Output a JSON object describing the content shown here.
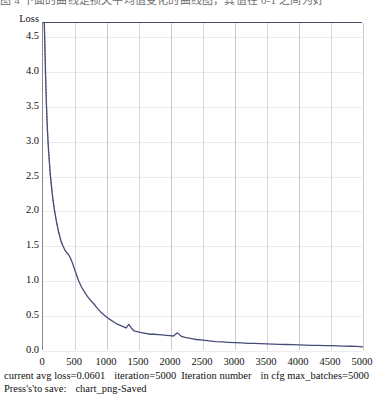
{
  "top_caption": "图 4  下面的曲线是损失平均值变化的曲线图，其值在 0-1 之间为好",
  "chart_data": {
    "type": "line",
    "title": "",
    "xlabel": "Iteration number",
    "ylabel": "Loss",
    "xlim": [
      0,
      5000
    ],
    "ylim": [
      0.0,
      4.7
    ],
    "grid": true,
    "legend": null,
    "xticks": [
      0,
      500,
      1000,
      1500,
      2000,
      2500,
      3000,
      3500,
      4000,
      4500,
      5000
    ],
    "yticks": [
      0.0,
      0.5,
      1.0,
      1.5,
      2.0,
      2.5,
      3.0,
      3.5,
      4.0,
      4.5
    ],
    "series": [
      {
        "name": "avg loss",
        "color": "#464c78",
        "x": [
          20,
          30,
          40,
          55,
          70,
          85,
          100,
          115,
          130,
          145,
          160,
          175,
          190,
          205,
          220,
          240,
          260,
          280,
          300,
          320,
          340,
          360,
          380,
          400,
          430,
          460,
          490,
          520,
          560,
          600,
          640,
          680,
          720,
          760,
          800,
          850,
          900,
          950,
          1000,
          1050,
          1100,
          1150,
          1200,
          1250,
          1300,
          1340,
          1380,
          1420,
          1460,
          1500,
          1560,
          1620,
          1680,
          1740,
          1800,
          1860,
          1920,
          1980,
          2040,
          2100,
          2160,
          2220,
          2280,
          2340,
          2400,
          2500,
          2600,
          2700,
          2800,
          2900,
          3000,
          3100,
          3200,
          3300,
          3400,
          3500,
          3600,
          3700,
          3800,
          3900,
          4000,
          4100,
          4200,
          4300,
          4400,
          4500,
          4600,
          4700,
          4800,
          4900,
          5000
        ],
        "y": [
          4.7,
          4.35,
          3.95,
          3.5,
          3.15,
          2.9,
          2.7,
          2.52,
          2.38,
          2.25,
          2.14,
          2.04,
          1.96,
          1.88,
          1.81,
          1.72,
          1.65,
          1.58,
          1.53,
          1.49,
          1.45,
          1.42,
          1.4,
          1.38,
          1.33,
          1.26,
          1.18,
          1.1,
          1.0,
          0.92,
          0.86,
          0.8,
          0.75,
          0.71,
          0.67,
          0.61,
          0.56,
          0.52,
          0.48,
          0.45,
          0.42,
          0.39,
          0.37,
          0.35,
          0.33,
          0.38,
          0.33,
          0.29,
          0.28,
          0.27,
          0.26,
          0.25,
          0.24,
          0.24,
          0.235,
          0.23,
          0.225,
          0.22,
          0.215,
          0.26,
          0.21,
          0.195,
          0.185,
          0.175,
          0.165,
          0.155,
          0.145,
          0.135,
          0.13,
          0.125,
          0.12,
          0.115,
          0.11,
          0.108,
          0.105,
          0.102,
          0.099,
          0.096,
          0.093,
          0.09,
          0.088,
          0.085,
          0.082,
          0.08,
          0.078,
          0.076,
          0.073,
          0.07,
          0.068,
          0.065,
          0.0601
        ]
      }
    ]
  },
  "status": {
    "current_avg_loss_label": "current avg loss=",
    "current_avg_loss_value": "0.0601",
    "iteration_label": "iteration=",
    "iteration_value": "5000",
    "iteration_number_label": "Iteration number",
    "max_batches_label": "in cfg max_batches=",
    "max_batches_value": "5000",
    "save_hint": "Press's'to save:",
    "save_status": "chart_png-Saved"
  }
}
